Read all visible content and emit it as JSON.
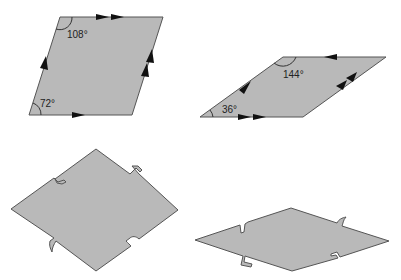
{
  "figure": {
    "fill_color": "#b9b9b9",
    "stroke_color": "#555555",
    "shapes": [
      {
        "id": "rhombus-wide",
        "angles": {
          "top_left": "108°",
          "bottom_left": "72°"
        },
        "edge_markings": {
          "top": "double-arrow",
          "right": "double-arrow",
          "bottom": "single-arrow",
          "left": "single-arrow"
        }
      },
      {
        "id": "rhombus-thin",
        "angles": {
          "top_left": "144°",
          "bottom_left": "36°"
        },
        "edge_markings": {
          "top": "single-arrow",
          "left": "single-arrow",
          "bottom": "double-arrow",
          "right": "double-arrow"
        }
      },
      {
        "id": "rhombus-wide-notched",
        "edge_markings": "tab-and-notch connectors"
      },
      {
        "id": "rhombus-thin-notched",
        "edge_markings": "tab-and-notch connectors"
      }
    ]
  }
}
